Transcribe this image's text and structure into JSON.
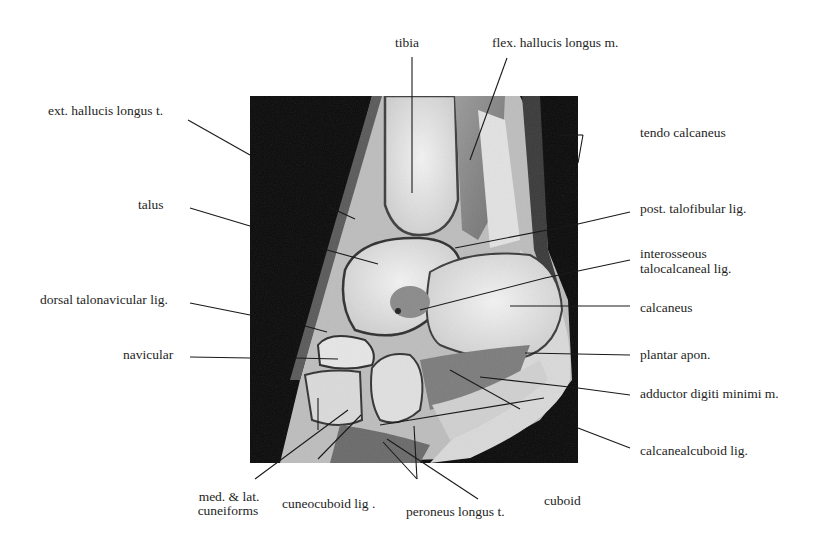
{
  "figure": {
    "image_description": "Sagittal MRI of the ankle and hindfoot",
    "labels": {
      "tibia": "tibia",
      "flex_hallucis": "flex. hallucis longus m.",
      "ext_hallucis": "ext. hallucis longus t.",
      "tendo_calcaneus": "tendo calcaneus",
      "talus": "talus",
      "post_talofibular": "post. talofibular lig.",
      "interosseous_1": "interosseous",
      "interosseous_2": "talocalcaneal lig.",
      "dorsal_talonavicular": "dorsal talonavicular lig.",
      "calcaneus": "calcaneus",
      "navicular": "navicular",
      "plantar_apon": "plantar apon.",
      "adductor": "adductor digiti minimi m.",
      "calcanealcuboid": "calcanealcuboid lig.",
      "cuneiforms_1": "med. & lat.",
      "cuneiforms_2": "cuneiforms",
      "cuneocuboid": "cuneocuboid lig .",
      "peroneus": "peroneus longus t.",
      "cuboid": "cuboid"
    }
  }
}
